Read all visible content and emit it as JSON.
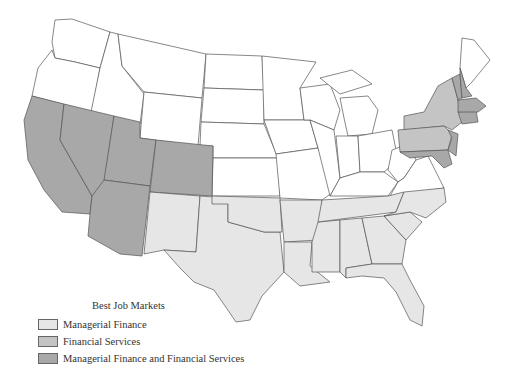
{
  "legend": {
    "title": "Best Job Markets",
    "items": [
      {
        "label": "Managerial Finance",
        "color": "#e6e6e6"
      },
      {
        "label": "Financial Services",
        "color": "#c4c4c4"
      },
      {
        "label": "Managerial Finance and Financial Services",
        "color": "#a8a8a8"
      }
    ]
  },
  "colors": {
    "none": "#ffffff",
    "managerial_finance": "#e6e6e6",
    "financial_services": "#c4c4c4",
    "both": "#a8a8a8",
    "border": "#555555"
  },
  "regions": {
    "managerial_finance": [
      "New Mexico",
      "Texas",
      "Oklahoma",
      "Arkansas",
      "Louisiana",
      "Mississippi",
      "Alabama",
      "Tennessee",
      "Georgia",
      "Florida",
      "South Carolina",
      "North Carolina"
    ],
    "financial_services": [
      "New York",
      "Pennsylvania"
    ],
    "both": [
      "California",
      "Nevada",
      "Utah",
      "Arizona",
      "Colorado",
      "New Jersey",
      "Connecticut",
      "Rhode Island",
      "Massachusetts",
      "Vermont",
      "New Hampshire",
      "Delaware",
      "Maryland"
    ]
  }
}
